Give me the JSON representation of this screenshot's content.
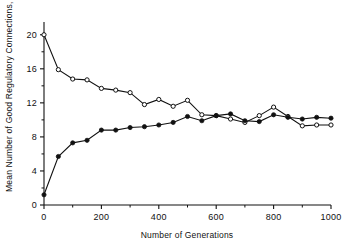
{
  "chart_data": {
    "type": "line",
    "title": "",
    "xlabel": "Number of Generations",
    "ylabel": "Mean Number of Good Regulatory Connections, G",
    "ylabel_symbol": "G",
    "ylabel_text_before_symbol": "Mean Number of Good Regulatory Connections, ",
    "xlim": [
      0,
      1000
    ],
    "ylim": [
      0,
      21.5
    ],
    "xticks": [
      0,
      200,
      400,
      600,
      800,
      1000
    ],
    "xtick_labels": [
      "0",
      "200",
      "400",
      "600",
      "800",
      "1000"
    ],
    "xminor_step": 100,
    "yticks": [
      0,
      4,
      8,
      12,
      16,
      20
    ],
    "ytick_labels": [
      "0",
      "4",
      "8",
      "12",
      "16",
      "20"
    ],
    "yminor_step": 2,
    "grid": false,
    "legend": "none",
    "x": [
      0,
      50,
      100,
      150,
      200,
      250,
      300,
      350,
      400,
      450,
      500,
      550,
      600,
      650,
      700,
      750,
      800,
      850,
      900,
      950,
      1000
    ],
    "series": [
      {
        "name": "open-circle-series",
        "marker": "open-circle",
        "color": "#111111",
        "values": [
          20.0,
          15.9,
          14.8,
          14.7,
          13.7,
          13.5,
          13.2,
          11.8,
          12.4,
          11.6,
          12.3,
          10.6,
          10.5,
          10.1,
          9.7,
          10.5,
          11.5,
          10.4,
          9.3,
          9.4,
          9.4
        ]
      },
      {
        "name": "filled-circle-series",
        "marker": "filled-circle",
        "color": "#111111",
        "values": [
          1.2,
          5.7,
          7.3,
          7.6,
          8.8,
          8.8,
          9.1,
          9.2,
          9.4,
          9.7,
          10.4,
          9.9,
          10.5,
          10.7,
          9.9,
          9.8,
          10.6,
          10.3,
          10.1,
          10.3,
          10.2
        ]
      }
    ]
  },
  "axis_style": {
    "line_color": "#111111",
    "axis_width": 1
  }
}
